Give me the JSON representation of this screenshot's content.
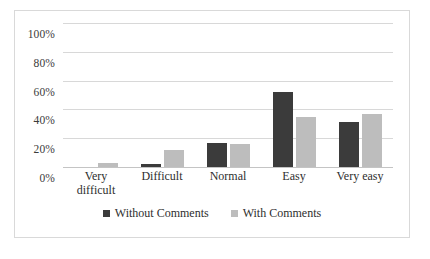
{
  "chart_data": {
    "type": "bar",
    "title": "",
    "subtitle": "",
    "xlabel": "",
    "ylabel": "",
    "categories": [
      "Very difficult",
      "Difficult",
      "Normal",
      "Easy",
      "Very easy"
    ],
    "category_lines": [
      [
        "Very",
        "difficult"
      ],
      [
        "Difficult"
      ],
      [
        "Normal"
      ],
      [
        "Easy"
      ],
      [
        "Very easy"
      ]
    ],
    "series": [
      {
        "name": "Without Comments",
        "color": "#3b3b3b",
        "values": [
          0,
          2,
          17,
          52,
          31.5
        ]
      },
      {
        "name": "With Comments",
        "color": "#bdbdbd",
        "values": [
          2.5,
          12,
          16,
          35,
          36.5
        ]
      }
    ],
    "ylim": [
      0,
      100
    ],
    "ytick_values": [
      0,
      20,
      40,
      60,
      80,
      100
    ],
    "ytick_labels": [
      "0%",
      "20%",
      "40%",
      "60%",
      "80%",
      "100%"
    ],
    "grid": true,
    "grid_axis": "y",
    "legend_position": "bottom-center",
    "value_suffix": "%",
    "border_color": "#d9d9d9",
    "gridline_color": "#d8d8d8",
    "background": "#ffffff"
  }
}
